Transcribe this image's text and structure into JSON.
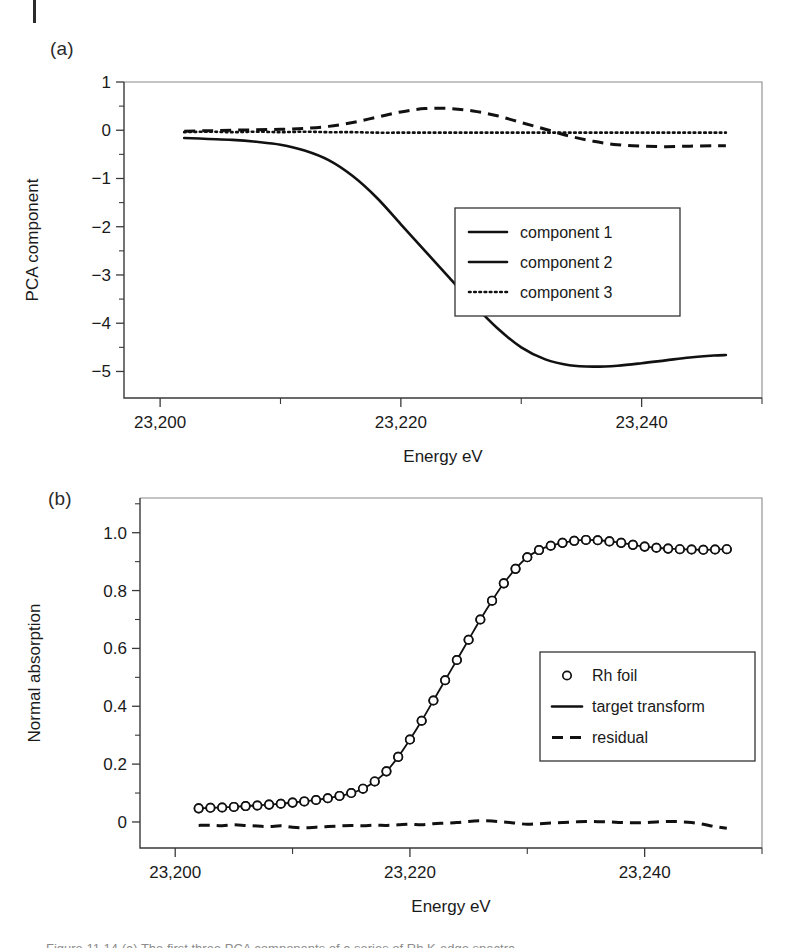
{
  "page": {
    "margin_rule": "left-margin-rule",
    "caption_partial": "Figure 11.14 (a) The first three PCA components of a series of Rh K-edge spectra."
  },
  "panels": [
    {
      "id": "a",
      "label": "(a)",
      "ylabel": "PCA component",
      "xlabel": "Energy eV",
      "legend": [
        {
          "label": "component 1",
          "style": "solid"
        },
        {
          "label": "component 2",
          "style": "solid"
        },
        {
          "label": "component 3",
          "style": "dotted"
        }
      ]
    },
    {
      "id": "b",
      "label": "(b)",
      "ylabel": "Normal absorption",
      "xlabel": "Energy eV",
      "legend": [
        {
          "label": "Rh foil",
          "style": "circle"
        },
        {
          "label": "target transform",
          "style": "solid"
        },
        {
          "label": "residual",
          "style": "dashed"
        }
      ]
    }
  ],
  "chart_data": [
    {
      "type": "line",
      "panel": "a",
      "title": "(a)",
      "xlabel": "Energy eV",
      "ylabel": "PCA component",
      "xlim": [
        23197,
        23250
      ],
      "ylim": [
        -5.55,
        1.0
      ],
      "xticks": [
        23200,
        23220,
        23240
      ],
      "xticklabels": [
        "23,200",
        "23,220",
        "23,240"
      ],
      "xticks_minor": [
        23210,
        23230,
        23250
      ],
      "yticks": [
        1,
        0,
        -1,
        -2,
        -3,
        -4,
        -5
      ],
      "yticklabels": [
        "1",
        "0",
        "-1",
        "-2",
        "-3",
        "-4",
        "-5"
      ],
      "yticks_minor": [
        0.5,
        -0.5,
        -1.5,
        -2.5,
        -3.5,
        -4.5
      ],
      "grid": false,
      "legend_position": "center-right",
      "x": [
        23202,
        23204,
        23206,
        23208,
        23210,
        23212,
        23214,
        23216,
        23218,
        23220,
        23222,
        23224,
        23226,
        23228,
        23230,
        23232,
        23234,
        23236,
        23238,
        23240,
        23242,
        23244,
        23246,
        23247
      ],
      "series": [
        {
          "name": "component 1",
          "style": "solid",
          "values": [
            -0.16,
            -0.18,
            -0.2,
            -0.24,
            -0.3,
            -0.42,
            -0.62,
            -0.95,
            -1.4,
            -1.95,
            -2.5,
            -3.05,
            -3.6,
            -4.1,
            -4.5,
            -4.75,
            -4.87,
            -4.9,
            -4.88,
            -4.83,
            -4.77,
            -4.71,
            -4.67,
            -4.66
          ]
        },
        {
          "name": "component 2",
          "style": "dashed",
          "values": [
            -0.02,
            -0.01,
            0.0,
            0.01,
            0.02,
            0.04,
            0.08,
            0.16,
            0.27,
            0.38,
            0.45,
            0.45,
            0.4,
            0.3,
            0.16,
            0.02,
            -0.12,
            -0.23,
            -0.3,
            -0.33,
            -0.34,
            -0.33,
            -0.32,
            -0.32
          ]
        },
        {
          "name": "component 3",
          "style": "dotted",
          "values": [
            -0.04,
            -0.03,
            -0.04,
            -0.03,
            -0.04,
            -0.03,
            -0.04,
            -0.04,
            -0.05,
            -0.05,
            -0.05,
            -0.05,
            -0.05,
            -0.05,
            -0.05,
            -0.05,
            -0.05,
            -0.05,
            -0.05,
            -0.05,
            -0.05,
            -0.05,
            -0.05,
            -0.05
          ]
        }
      ]
    },
    {
      "type": "line",
      "panel": "b",
      "title": "(b)",
      "xlabel": "Energy eV",
      "ylabel": "Normal absorption",
      "xlim": [
        23197,
        23250
      ],
      "ylim": [
        -0.09,
        1.12
      ],
      "xticks": [
        23200,
        23220,
        23240
      ],
      "xticklabels": [
        "23,200",
        "23,220",
        "23,240"
      ],
      "xticks_minor": [
        23210,
        23230,
        23250
      ],
      "yticks": [
        0,
        0.2,
        0.4,
        0.6,
        0.8,
        1.0
      ],
      "yticklabels": [
        "0",
        "0.2",
        "0.4",
        "0.6",
        "0.8",
        "1.0"
      ],
      "yticks_minor": [
        0.1,
        0.3,
        0.5,
        0.7,
        0.9,
        1.1
      ],
      "grid": false,
      "legend_position": "center-right",
      "x": [
        23202,
        23203,
        23204,
        23205,
        23206,
        23207,
        23208,
        23209,
        23210,
        23211,
        23212,
        23213,
        23214,
        23215,
        23216,
        23217,
        23218,
        23219,
        23220,
        23221,
        23222,
        23223,
        23224,
        23225,
        23226,
        23227,
        23228,
        23229,
        23230,
        23231,
        23232,
        23233,
        23234,
        23235,
        23236,
        23237,
        23238,
        23239,
        23240,
        23241,
        23242,
        23243,
        23244,
        23245,
        23246,
        23247
      ],
      "series": [
        {
          "name": "Rh foil",
          "style": "circle",
          "values": [
            0.047,
            0.049,
            0.05,
            0.052,
            0.055,
            0.057,
            0.06,
            0.063,
            0.067,
            0.071,
            0.076,
            0.082,
            0.09,
            0.1,
            0.115,
            0.14,
            0.175,
            0.225,
            0.285,
            0.35,
            0.42,
            0.49,
            0.56,
            0.63,
            0.7,
            0.765,
            0.825,
            0.875,
            0.915,
            0.94,
            0.955,
            0.965,
            0.972,
            0.975,
            0.974,
            0.97,
            0.965,
            0.958,
            0.952,
            0.948,
            0.945,
            0.943,
            0.942,
            0.941,
            0.942,
            0.943
          ]
        },
        {
          "name": "target transform",
          "style": "solid",
          "values": [
            0.047,
            0.049,
            0.05,
            0.052,
            0.055,
            0.057,
            0.06,
            0.063,
            0.067,
            0.071,
            0.076,
            0.082,
            0.09,
            0.1,
            0.115,
            0.14,
            0.175,
            0.225,
            0.285,
            0.35,
            0.42,
            0.49,
            0.56,
            0.63,
            0.7,
            0.765,
            0.825,
            0.875,
            0.915,
            0.94,
            0.955,
            0.965,
            0.972,
            0.975,
            0.974,
            0.97,
            0.965,
            0.958,
            0.952,
            0.948,
            0.945,
            0.943,
            0.942,
            0.941,
            0.942,
            0.943
          ]
        },
        {
          "name": "residual",
          "style": "dashed",
          "values": [
            -0.012,
            -0.011,
            -0.013,
            -0.01,
            -0.012,
            -0.014,
            -0.016,
            -0.013,
            -0.018,
            -0.02,
            -0.018,
            -0.016,
            -0.014,
            -0.012,
            -0.013,
            -0.011,
            -0.012,
            -0.01,
            -0.008,
            -0.01,
            -0.006,
            -0.004,
            -0.002,
            0.002,
            0.004,
            0.003,
            0.0,
            -0.004,
            -0.008,
            -0.006,
            -0.004,
            -0.002,
            0.0,
            0.002,
            0.001,
            0.0,
            -0.002,
            -0.003,
            -0.002,
            0.0,
            0.002,
            0.001,
            -0.002,
            -0.008,
            -0.016,
            -0.022
          ]
        }
      ]
    }
  ]
}
